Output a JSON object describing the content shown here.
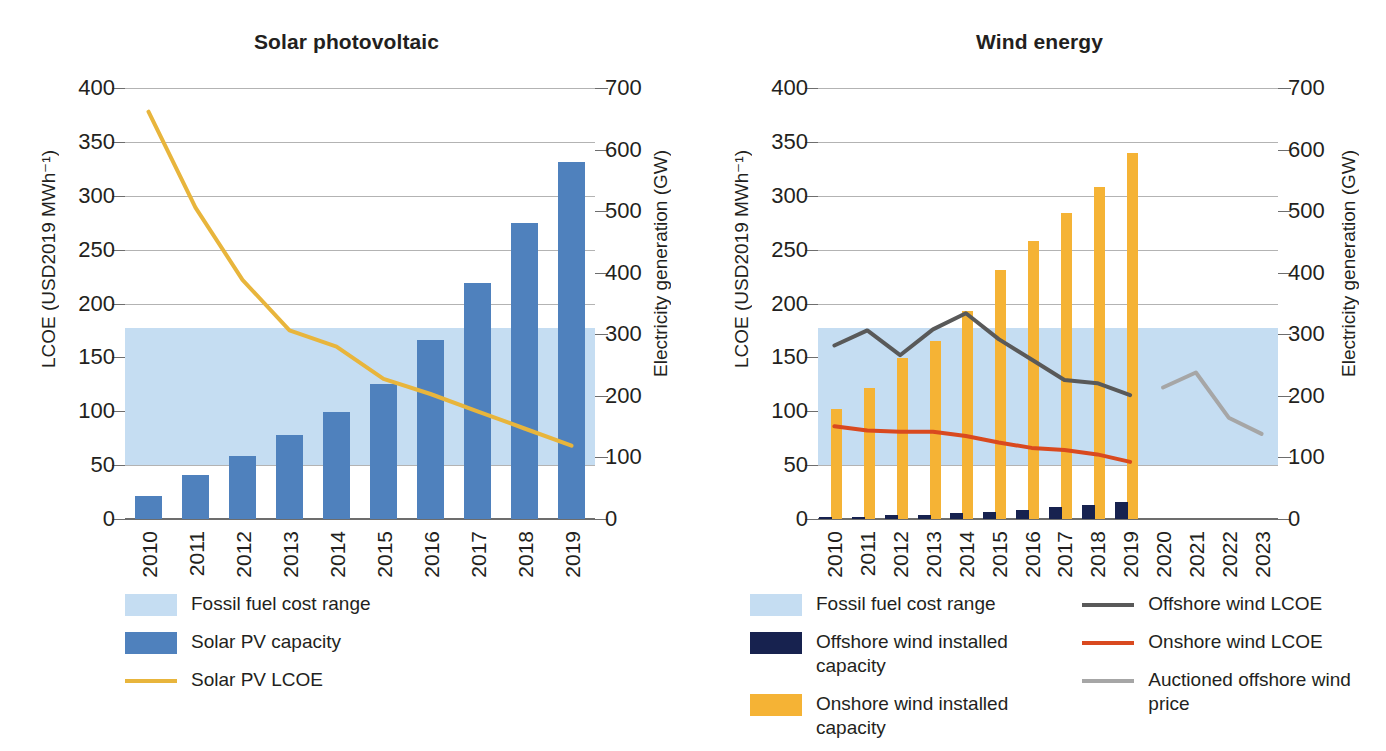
{
  "chart_data": [
    {
      "type": "bar",
      "title": "Solar photovoltaic",
      "xlabel": "",
      "ylabel": "LCOE (USD2019 MWh⁻¹)",
      "y2label": "Electricity generation (GW)",
      "categories": [
        "2010",
        "2011",
        "2012",
        "2013",
        "2014",
        "2015",
        "2016",
        "2017",
        "2018",
        "2019"
      ],
      "ylim": [
        0,
        400
      ],
      "yticks": [
        0,
        50,
        100,
        150,
        200,
        250,
        300,
        350,
        400
      ],
      "y2lim": [
        0,
        700
      ],
      "y2ticks": [
        0,
        100,
        200,
        300,
        400,
        500,
        600,
        700
      ],
      "grid": true,
      "legend_position": "below-left",
      "bands": [
        {
          "name": "Fossil fuel cost range",
          "axis": "left",
          "from": 50,
          "to": 177,
          "color": "#c5ddf2"
        }
      ],
      "series": [
        {
          "name": "Solar PV capacity",
          "type": "bar",
          "axis": "right",
          "unit": "GW",
          "color": "#4f81bd",
          "values": [
            38,
            72,
            102,
            136,
            174,
            219,
            291,
            383,
            481,
            580
          ]
        },
        {
          "name": "Solar PV LCOE",
          "type": "line",
          "axis": "left",
          "unit": "USD2019 MWh-1",
          "color": "#e8b53c",
          "values": [
            378,
            289,
            222,
            175,
            160,
            130,
            116,
            100,
            84,
            68
          ]
        }
      ]
    },
    {
      "type": "bar",
      "title": "Wind energy",
      "xlabel": "",
      "ylabel": "LCOE (USD2019 MWh⁻¹)",
      "y2label": "Electricity generation (GW)",
      "categories": [
        "2010",
        "2011",
        "2012",
        "2013",
        "2014",
        "2015",
        "2016",
        "2017",
        "2018",
        "2019",
        "2020",
        "2021",
        "2022",
        "2023"
      ],
      "ylim": [
        0,
        400
      ],
      "yticks": [
        0,
        50,
        100,
        150,
        200,
        250,
        300,
        350,
        400
      ],
      "y2lim": [
        0,
        700
      ],
      "y2ticks": [
        0,
        100,
        200,
        300,
        400,
        500,
        600,
        700
      ],
      "grid": true,
      "legend_position": "below",
      "bands": [
        {
          "name": "Fossil fuel cost range",
          "axis": "left",
          "from": 50,
          "to": 177,
          "color": "#c5ddf2"
        }
      ],
      "series": [
        {
          "name": "Onshore wind installed capacity",
          "type": "bar",
          "axis": "right",
          "unit": "GW",
          "color": "#f5b335",
          "values": [
            178,
            213,
            262,
            289,
            338,
            404,
            452,
            497,
            540,
            594,
            null,
            null,
            null,
            null
          ]
        },
        {
          "name": "Offshore wind installed capacity",
          "type": "bar",
          "axis": "right",
          "unit": "GW",
          "color": "#17224f",
          "values": [
            3,
            4,
            6,
            7,
            9,
            12,
            14,
            19,
            23,
            28,
            null,
            null,
            null,
            null
          ]
        },
        {
          "name": "Offshore wind LCOE",
          "type": "line",
          "axis": "left",
          "unit": "USD2019 MWh-1",
          "color": "#595959",
          "values": [
            161,
            175,
            152,
            176,
            191,
            167,
            148,
            129,
            126,
            115,
            null,
            null,
            null,
            null
          ]
        },
        {
          "name": "Onshore wind LCOE",
          "type": "line",
          "axis": "left",
          "unit": "USD2019 MWh-1",
          "color": "#d9491f",
          "values": [
            86,
            82,
            81,
            81,
            77,
            71,
            66,
            64,
            60,
            53,
            null,
            null,
            null,
            null
          ]
        },
        {
          "name": "Auctioned offshore wind price",
          "type": "line",
          "axis": "left",
          "unit": "USD2019 MWh-1",
          "color": "#a6a6a6",
          "values": [
            null,
            null,
            null,
            null,
            null,
            null,
            null,
            null,
            null,
            null,
            122,
            136,
            94,
            79
          ]
        }
      ]
    }
  ],
  "left_chart": {
    "title": "Solar photovoltaic",
    "y_axis_label": "LCOE (USD2019 MWh⁻¹)",
    "y2_axis_label": "Electricity generation (GW)",
    "y_ticks": [
      "0",
      "50",
      "100",
      "150",
      "200",
      "250",
      "300",
      "350",
      "400"
    ],
    "y2_ticks": [
      "0",
      "100",
      "200",
      "300",
      "400",
      "500",
      "600",
      "700"
    ],
    "x_ticks": [
      "2010",
      "2011",
      "2012",
      "2013",
      "2014",
      "2015",
      "2016",
      "2017",
      "2018",
      "2019"
    ],
    "legend": [
      {
        "label": "Fossil fuel cost range",
        "marker": "swatch",
        "color": "#c5ddf2"
      },
      {
        "label": "Solar PV capacity",
        "marker": "swatch",
        "color": "#4f81bd"
      },
      {
        "label": "Solar PV LCOE",
        "marker": "line",
        "color": "#e8b53c"
      }
    ]
  },
  "right_chart": {
    "title": "Wind energy",
    "y_axis_label": "LCOE (USD2019 MWh⁻¹)",
    "y2_axis_label": "Electricity generation (GW)",
    "y_ticks": [
      "0",
      "50",
      "100",
      "150",
      "200",
      "250",
      "300",
      "350",
      "400"
    ],
    "y2_ticks": [
      "0",
      "100",
      "200",
      "300",
      "400",
      "500",
      "600",
      "700"
    ],
    "x_ticks": [
      "2010",
      "2011",
      "2012",
      "2013",
      "2014",
      "2015",
      "2016",
      "2017",
      "2018",
      "2019",
      "2020",
      "2021",
      "2022",
      "2023"
    ],
    "legend_col1": [
      {
        "label": "Fossil fuel cost range",
        "marker": "swatch",
        "color": "#c5ddf2"
      },
      {
        "label": "Offshore wind installed capacity",
        "marker": "swatch",
        "color": "#17224f"
      },
      {
        "label": "Onshore wind installed capacity",
        "marker": "swatch",
        "color": "#f5b335"
      }
    ],
    "legend_col2": [
      {
        "label": "Offshore wind LCOE",
        "marker": "line",
        "color": "#595959"
      },
      {
        "label": "Onshore wind LCOE",
        "marker": "line",
        "color": "#d9491f"
      },
      {
        "label": "Auctioned offshore wind price",
        "marker": "line",
        "color": "#a6a6a6"
      }
    ]
  }
}
